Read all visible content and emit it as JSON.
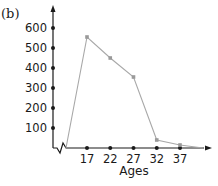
{
  "panel_label": "(b)",
  "chart_data": {
    "type": "line",
    "title": "",
    "xlabel": "Ages",
    "ylabel": "",
    "x": [
      17,
      22,
      27,
      32,
      37
    ],
    "series": [
      {
        "name": "frequency",
        "values": [
          555,
          450,
          355,
          40,
          15
        ]
      }
    ],
    "x_tick_labels": [
      "17",
      "22",
      "27",
      "32",
      "37"
    ],
    "y_tick_labels": [
      "100",
      "200",
      "300",
      "400",
      "500",
      "600"
    ],
    "y_ticks": [
      100,
      200,
      300,
      400,
      500,
      600
    ],
    "ylim": [
      0,
      650
    ],
    "grid": false,
    "legend": null,
    "axis_break": "y-axis break (zigzag) near origin",
    "line_color": "#a8a8a8",
    "marker_color": "#9a9a9a",
    "axis_color": "#1a1a1a"
  }
}
